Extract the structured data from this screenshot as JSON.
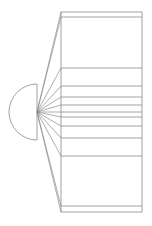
{
  "chart_data": {
    "type": "bar-of-pie",
    "title": "",
    "xlabel": "",
    "ylabel": "",
    "legend": [],
    "grid": false,
    "pie": {
      "center": [
        37,
        112
      ],
      "radius": 28,
      "visible_portion": "left semicircle with diameter line"
    },
    "bar": {
      "x_left": 61,
      "x_right": 142,
      "y_top": 12,
      "y_bottom": 212,
      "segment_boundaries_y": [
        12,
        17,
        68,
        86,
        97,
        105,
        112,
        117,
        126,
        138,
        156,
        206,
        212
      ],
      "segment_heights_px": [
        5,
        51,
        18,
        11,
        8,
        7,
        5,
        9,
        12,
        18,
        50,
        6
      ],
      "segment_share_percent": [
        2.5,
        25.5,
        9,
        5.5,
        4,
        3.5,
        2.5,
        4.5,
        6,
        9,
        25,
        3
      ]
    },
    "colors": {
      "stroke": "#8a8a8a",
      "background": "#ffffff"
    }
  }
}
